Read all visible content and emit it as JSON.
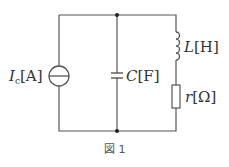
{
  "figure": {
    "caption": "図 1",
    "stroke_color": "#555555"
  },
  "components": {
    "current_source": {
      "symbol": "I",
      "subscript": "c",
      "unit": "[A]"
    },
    "capacitor": {
      "symbol": "C",
      "unit": "[F]"
    },
    "inductor": {
      "symbol": "L",
      "unit": "[H]"
    },
    "resistor": {
      "symbol": "r",
      "unit": "[Ω]"
    }
  }
}
